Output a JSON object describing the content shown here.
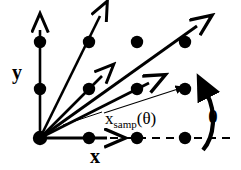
{
  "figure": {
    "background_color": "#ffffff",
    "ink_color": "#000000",
    "width": 241,
    "height": 170
  },
  "labels": {
    "y_axis": "y",
    "x_axis": "x",
    "theta": "θ",
    "samp_base": "x",
    "samp_sub": "samp",
    "samp_arg": "(θ)"
  },
  "lattice": {
    "note": "grid of filled sample points",
    "dot_radius": 6.2,
    "points": [
      {
        "name": "dot-row1-col1",
        "x": 40,
        "y": 42
      },
      {
        "name": "dot-row1-col2",
        "x": 89,
        "y": 42
      },
      {
        "name": "dot-row1-col3",
        "x": 137,
        "y": 42
      },
      {
        "name": "dot-row1-col4",
        "x": 185,
        "y": 42
      },
      {
        "name": "dot-row2-col1",
        "x": 40,
        "y": 89
      },
      {
        "name": "dot-row2-col2",
        "x": 89,
        "y": 89
      },
      {
        "name": "dot-row2-col3",
        "x": 137,
        "y": 89
      },
      {
        "name": "dot-row2-col4",
        "x": 185,
        "y": 89
      },
      {
        "name": "dot-origin",
        "x": 40,
        "y": 138
      },
      {
        "name": "dot-row3-col2",
        "x": 89,
        "y": 138
      },
      {
        "name": "dot-row3-col3",
        "x": 137,
        "y": 138
      },
      {
        "name": "dot-row3-col4",
        "x": 185,
        "y": 138
      }
    ]
  },
  "origin": {
    "x": 40,
    "y": 138
  },
  "vectors": {
    "note": "thick sampling direction arrows fanning out from the origin",
    "items": [
      {
        "name": "vector-y-axis",
        "x2": 40,
        "y2": 28,
        "width": 2.6
      },
      {
        "name": "vector-steep",
        "x2": 101,
        "y2": 13,
        "width": 2.6
      },
      {
        "name": "vector-mid-upper",
        "x2": 103,
        "y2": 74,
        "width": 2.6
      },
      {
        "name": "vector-diagonal",
        "x2": 199,
        "y2": 23,
        "width": 2.8
      },
      {
        "name": "vector-mid-lower",
        "x2": 151,
        "y2": 81,
        "width": 2.8
      },
      {
        "name": "vector-x-axis",
        "x2": 109,
        "y2": 138,
        "width": 2.8
      }
    ]
  },
  "samp_vector": {
    "name": "vector-x-samp",
    "description": "thin arrow to the sampled lattice point",
    "x1": 104,
    "y1": 113,
    "x2": 181,
    "y2": 88,
    "width": 1.1
  },
  "leader": {
    "name": "label-leader-line",
    "description": "thin pointer from the x_samp label toward the origin fan",
    "x1": 101,
    "y1": 112,
    "x2": 63,
    "y2": 124,
    "width": 1.0
  },
  "dashed_axis": {
    "name": "x-axis-dashed-extension",
    "x1": 110,
    "y1": 138,
    "x2": 235,
    "y2": 138,
    "dash": "8 6",
    "width": 2.2
  },
  "theta_arc": {
    "name": "theta-angle-arc",
    "description": "thick arc with arrowhead sweeping from the dashed x-axis up to the top-right vector",
    "width": 4.2
  }
}
